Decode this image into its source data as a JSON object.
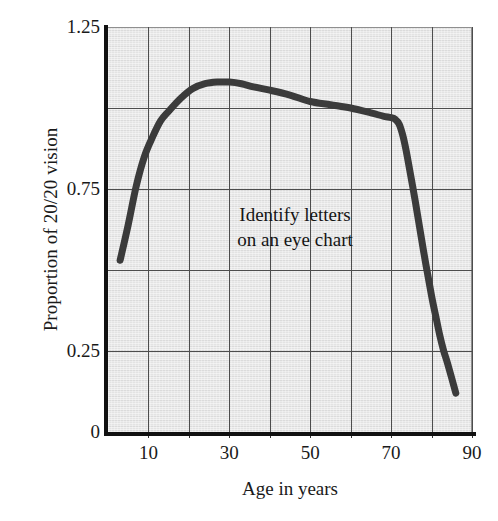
{
  "chart_data": {
    "type": "line",
    "title": "",
    "xlabel": "Age in years",
    "ylabel": "Proportion of 20/20 vision",
    "xlim": [
      0,
      90
    ],
    "ylim": [
      0,
      1.25
    ],
    "grid": true,
    "legend": null,
    "xticks": [
      0,
      10,
      20,
      30,
      40,
      50,
      60,
      70,
      80,
      90
    ],
    "xtick_labels": [
      "",
      "10",
      "",
      "30",
      "",
      "50",
      "",
      "70",
      "",
      "90"
    ],
    "yticks": [
      0,
      0.25,
      0.5,
      0.75,
      1.0,
      1.25
    ],
    "ytick_labels": [
      "0",
      "0.25",
      "",
      "0.75",
      "",
      "1.25"
    ],
    "annotations": [
      {
        "text_line_1": "Identify letters",
        "text_line_2": "on an eye chart",
        "x": 40,
        "y": 0.62
      }
    ],
    "series": [
      {
        "name": "Proportion of 20/20 vision",
        "color": "#3b3b3b",
        "x": [
          3,
          5,
          7,
          9,
          11,
          13,
          15,
          18,
          21,
          24,
          27,
          30,
          33,
          36,
          40,
          45,
          50,
          55,
          60,
          65,
          68,
          70,
          71,
          72,
          73,
          74,
          76,
          78,
          80,
          81,
          82,
          83,
          84,
          86
        ],
        "y": [
          0.53,
          0.64,
          0.76,
          0.85,
          0.91,
          0.96,
          0.99,
          1.03,
          1.06,
          1.075,
          1.08,
          1.08,
          1.075,
          1.065,
          1.055,
          1.04,
          1.02,
          1.01,
          1.0,
          0.985,
          0.975,
          0.97,
          0.965,
          0.95,
          0.91,
          0.85,
          0.71,
          0.56,
          0.42,
          0.36,
          0.3,
          0.25,
          0.21,
          0.12
        ]
      }
    ]
  },
  "axes": {
    "y_title": "Proportion of 20/20 vision",
    "x_title": "Age in years",
    "y_labels": [
      {
        "value": "1.25",
        "pos": 1.25
      },
      {
        "value": "0.75",
        "pos": 0.75
      },
      {
        "value": "0.25",
        "pos": 0.25
      },
      {
        "value": "0",
        "pos": 0.0
      }
    ],
    "x_labels": [
      {
        "value": "10",
        "pos": 10
      },
      {
        "value": "30",
        "pos": 30
      },
      {
        "value": "50",
        "pos": 50
      },
      {
        "value": "70",
        "pos": 70
      },
      {
        "value": "90",
        "pos": 90
      }
    ]
  },
  "annotation": {
    "line1": "Identify letters",
    "line2": "on an eye chart"
  },
  "colors": {
    "plot_background": "#e3e3e3",
    "curve": "#3b3b3b",
    "gridline": "#4d4d4d",
    "spine": "#111111",
    "text": "#1a1a1a"
  }
}
